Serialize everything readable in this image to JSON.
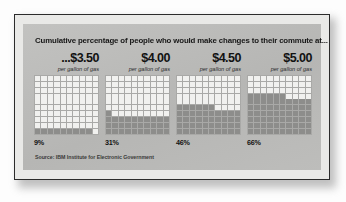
{
  "figure": {
    "title": "Cumulative percentage of people who would make changes to their commute at...",
    "source": "Source: IBM Institute for Electronic Government"
  },
  "columns": [
    {
      "price": "...$3.50",
      "unit": "per gallon of gas",
      "percent_label": "9%",
      "value": 9
    },
    {
      "price": "$4.00",
      "unit": "per gallon of gas",
      "percent_label": "31%",
      "value": 31
    },
    {
      "price": "$4.50",
      "unit": "per gallon of gas",
      "percent_label": "46%",
      "value": 46
    },
    {
      "price": "$5.00",
      "unit": "per gallon of gas",
      "percent_label": "66%",
      "value": 66
    }
  ],
  "style": {
    "panel_bg": "#bcbcbc",
    "frame_border": "#2b2b2b",
    "cell_empty": "#f1f1ef",
    "cell_filled": "#8d8d8b",
    "text_color": "#121212"
  },
  "chart_data": {
    "type": "bar",
    "subtype": "waffle-grid",
    "title": "Cumulative percentage of people who would make changes to their commute at...",
    "xlabel": "",
    "ylabel": "Cumulative percentage of people",
    "categories": [
      "...$3.50 per gallon of gas",
      "$4.00 per gallon of gas",
      "$4.50 per gallon of gas",
      "$5.00 per gallon of gas"
    ],
    "values": [
      9,
      31,
      46,
      66
    ],
    "value_labels": [
      "9%",
      "31%",
      "46%",
      "66%"
    ],
    "units": "percent",
    "ylim": [
      0,
      100
    ],
    "grid": true,
    "legend": false,
    "waffle_rows": 10,
    "waffle_columns": 10,
    "waffle_fill_order": "bottom-left-row-major",
    "annotations": [
      "Source: IBM Institute for Electronic Government"
    ]
  }
}
